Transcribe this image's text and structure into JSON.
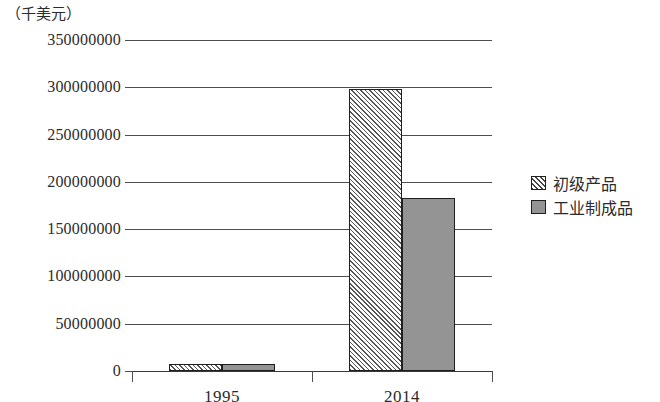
{
  "chart_data": {
    "type": "bar",
    "title": "",
    "subtitle": "",
    "unit_caption": "（千美元）",
    "xlabel": "",
    "ylabel": "",
    "categories": [
      "1995",
      "2014"
    ],
    "series": [
      {
        "name": "初级产品",
        "values": [
          7400000,
          298000000
        ],
        "pattern": "diagonal-hatch",
        "color": "#ffffff"
      },
      {
        "name": "工业制成品",
        "values": [
          7400000,
          183000000
        ],
        "pattern": "solid",
        "color": "#949494"
      }
    ],
    "ylim": [
      0,
      350000000
    ],
    "ytick_values": [
      0,
      50000000,
      100000000,
      150000000,
      200000000,
      250000000,
      300000000,
      350000000
    ],
    "ytick_labels": [
      "0",
      "50000000",
      "100000000",
      "150000000",
      "200000000",
      "250000000",
      "300000000",
      "350000000"
    ],
    "grid": true,
    "grid_axis": "y",
    "legend_position": "right",
    "legend_entries": [
      "初级产品",
      "工业制成品"
    ],
    "colors": {
      "gridline": "#4d4d4d",
      "bar_border": "#1f1f1f",
      "solid_fill": "#949494",
      "hatch_stroke": "#555555",
      "text": "#2b2b2b",
      "background": "#ffffff"
    }
  }
}
